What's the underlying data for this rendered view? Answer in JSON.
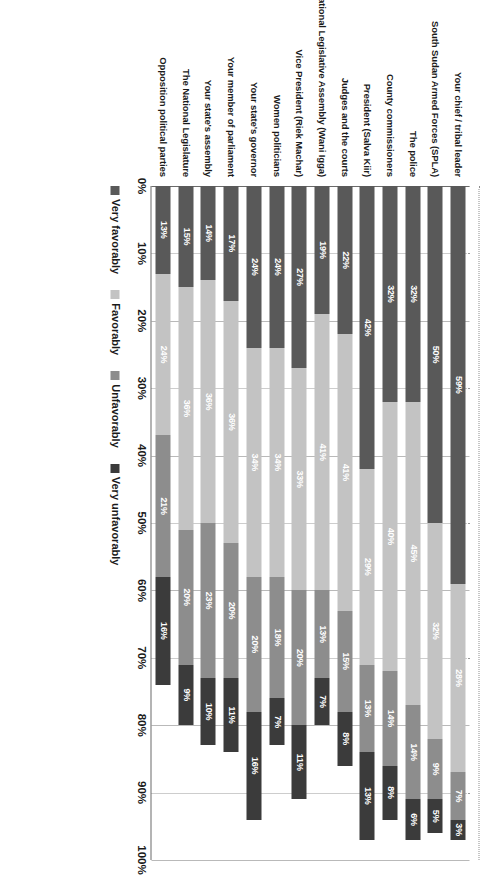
{
  "chart_data": {
    "type": "bar",
    "orientation": "horizontal-stacked",
    "stacked": true,
    "stack_mode": "percent",
    "title": "",
    "subtitle": "",
    "xlabel": "",
    "ylabel": "",
    "xlim": [
      0,
      100
    ],
    "xticks": [
      "0%",
      "10%",
      "20%",
      "30%",
      "40%",
      "50%",
      "60%",
      "70%",
      "80%",
      "90%",
      "100%"
    ],
    "xtick_values": [
      0,
      10,
      20,
      30,
      40,
      50,
      60,
      70,
      80,
      90,
      100
    ],
    "grid": true,
    "grid_axis": "x",
    "legend_position": "bottom",
    "categories": [
      "Your chief / tribal leader",
      "South Sudan Armed Forces (SPLA)",
      "The police",
      "County commissioners",
      "President (Salva Kiir)",
      "Judges and the courts",
      "Speaker of National Legislative Assembly (Wani Igga)",
      "Vice President (Riek Machar)",
      "Women politicians",
      "Your state's governor",
      "Your member of parliament",
      "Your state's assembly",
      "The National Legislature",
      "Opposition political parties"
    ],
    "series": [
      {
        "name": "Very favorably",
        "color": "#595959",
        "values": [
          59,
          50,
          32,
          32,
          42,
          22,
          19,
          27,
          24,
          24,
          17,
          14,
          15,
          13
        ],
        "labels": [
          "59%",
          "50%",
          "32%",
          "32%",
          "42%",
          "22%",
          "19%",
          "27%",
          "24%",
          "24%",
          "17%",
          "14%",
          "15%",
          "13%"
        ]
      },
      {
        "name": "Favorably",
        "color": "#c3c3c3",
        "values": [
          28,
          32,
          45,
          40,
          29,
          41,
          41,
          33,
          34,
          34,
          36,
          36,
          36,
          24
        ],
        "labels": [
          "28%",
          "32%",
          "45%",
          "40%",
          "29%",
          "41%",
          "41%",
          "33%",
          "34%",
          "34%",
          "36%",
          "36%",
          "36%",
          "24%"
        ]
      },
      {
        "name": "Unfavorably",
        "color": "#8d8d8d",
        "values": [
          7,
          9,
          14,
          14,
          13,
          15,
          13,
          20,
          18,
          20,
          20,
          23,
          20,
          21
        ],
        "labels": [
          "7%",
          "9%",
          "14%",
          "14%",
          "13%",
          "15%",
          "13%",
          "20%",
          "18%",
          "20%",
          "20%",
          "23%",
          "20%",
          "21%"
        ]
      },
      {
        "name": "Very unfavorably",
        "color": "#3b3b3b",
        "values": [
          3,
          5,
          6,
          8,
          13,
          8,
          7,
          11,
          7,
          16,
          11,
          10,
          9,
          16
        ],
        "labels": [
          "3%",
          "5%",
          "6%",
          "8%",
          "13%",
          "8%",
          "7%",
          "11%",
          "7%",
          "16%",
          "11%",
          "10%",
          "9%",
          "16%"
        ]
      }
    ]
  },
  "legend": {
    "items": [
      {
        "label": "Very favorably",
        "color": "#595959"
      },
      {
        "label": "Favorably",
        "color": "#c3c3c3"
      },
      {
        "label": "Unfavorably",
        "color": "#8d8d8d"
      },
      {
        "label": "Very unfavorably",
        "color": "#3b3b3b"
      }
    ]
  }
}
